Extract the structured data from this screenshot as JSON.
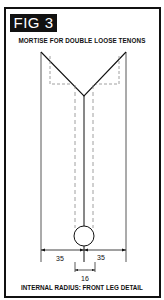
{
  "figure": {
    "label": "FIG 3",
    "title": "MORTISE FOR DOUBLE LOOSE TENONS",
    "caption": "INTERNAL RADIUS: FRONT LEG DETAIL"
  },
  "dimensions": {
    "left_width": "35",
    "right_width": "35",
    "hole_width": "16"
  },
  "colors": {
    "ink": "#111111",
    "dashed": "#888888",
    "background": "#ffffff"
  }
}
